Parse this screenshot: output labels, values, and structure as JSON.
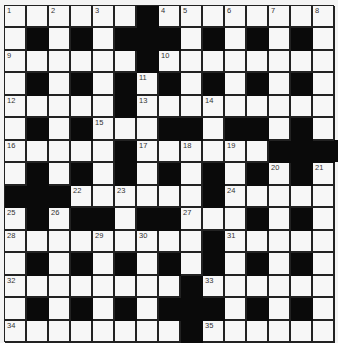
{
  "puzzle": {
    "rows": 15,
    "cols": 15,
    "layout": [
      "1.2.3.#45.6.7.8",
      ".#.#.###.#.#.#.",
      "9.....#10.......",
      ".#.#.#11#.#.#.#.",
      "12....#13..14.....",
      ".#.#15..##.##.#.",
      "16....#17.18.19.###",
      ".#.#.#.#.#.#20#21",
      "###22.23...#24....",
      "25#26##.##27..#.#.",
      "2829...30..#31....",
      ".#.#.#.#.#.#.#.",
      "32.......#33.....",
      ".#.#.#.###.#.#.",
      "34.......#35....."
    ],
    "grid": [
      [
        "1",
        "",
        "2",
        "",
        "3",
        "",
        "#",
        "4",
        "5",
        "",
        "6",
        "",
        "7",
        "",
        "8"
      ],
      [
        "",
        "#",
        "",
        "#",
        "",
        "#",
        "#",
        "#",
        "",
        "#",
        "",
        "#",
        "",
        "#",
        ""
      ],
      [
        "9",
        "",
        "",
        "",
        "",
        "",
        "#",
        "10",
        "",
        "",
        "",
        "",
        "",
        "",
        ""
      ],
      [
        "",
        "#",
        "",
        "#",
        "",
        "#",
        "11",
        "#",
        "",
        "#",
        "",
        "#",
        "",
        "#",
        ""
      ],
      [
        "12",
        "",
        "",
        "",
        "",
        "#",
        "13",
        "",
        "",
        "14",
        "",
        "",
        "",
        "",
        ""
      ],
      [
        "",
        "#",
        "",
        "#",
        "15",
        "",
        "",
        "#",
        "#",
        "",
        "#",
        "#",
        "",
        "#",
        ""
      ],
      [
        "16",
        "",
        "",
        "",
        "",
        "#",
        "17",
        "",
        "18",
        "",
        "19",
        "",
        "#",
        "#",
        "#"
      ],
      [
        "",
        "#",
        "",
        "#",
        "",
        "#",
        "",
        "#",
        "",
        "#",
        "",
        "#",
        "20",
        "#",
        "21"
      ],
      [
        "#",
        "#",
        "#",
        "22",
        "",
        "23",
        "",
        "",
        "",
        "#",
        "24",
        "",
        "",
        "",
        ""
      ],
      [
        "25",
        "#",
        "26",
        "#",
        "#",
        "",
        "#",
        "#",
        "27",
        "",
        "",
        "#",
        "",
        "#",
        ""
      ],
      [
        "28",
        "",
        "",
        "",
        "29",
        "",
        "30",
        "",
        "",
        "#",
        "31",
        "",
        "",
        "",
        ""
      ],
      [
        "",
        "#",
        "",
        "#",
        "",
        "#",
        "",
        "#",
        "",
        "#",
        "",
        "#",
        "",
        "#",
        ""
      ],
      [
        "32",
        "",
        "",
        "",
        "",
        "",
        "",
        "",
        "#",
        "33",
        "",
        "",
        "",
        "",
        ""
      ],
      [
        "",
        "#",
        "",
        "#",
        "",
        "#",
        "",
        "#",
        "#",
        "#",
        "",
        "#",
        "",
        "#",
        ""
      ],
      [
        "34",
        "",
        "",
        "",
        "",
        "",
        "",
        "",
        "#",
        "35",
        "",
        "",
        "",
        "",
        ""
      ]
    ],
    "colors": {
      "white_cell": "#f7f7f7",
      "black_cell": "#0a0a0a",
      "grid_line": "#222222",
      "number_text": "#333333"
    }
  }
}
